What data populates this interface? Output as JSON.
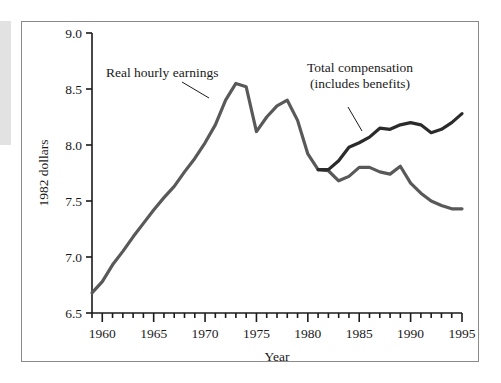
{
  "chart_data": {
    "type": "line",
    "title": "",
    "xlabel": "Year",
    "ylabel": "1982 dollars",
    "xlim": [
      1959,
      1995
    ],
    "ylim": [
      6.5,
      9.0
    ],
    "grid": false,
    "legend_position": "inline-annotations",
    "x_tick_labels": [
      "1960",
      "1965",
      "1970",
      "1975",
      "1980",
      "1985",
      "1990",
      "1995"
    ],
    "x_tick_values": [
      1960,
      1965,
      1970,
      1975,
      1980,
      1985,
      1990,
      1995
    ],
    "x_minor_tick_step": 1,
    "y_tick_labels": [
      "6.5",
      "7.0",
      "7.5",
      "8.0",
      "8.5",
      "9.0"
    ],
    "y_tick_values": [
      6.5,
      7.0,
      7.5,
      8.0,
      8.5,
      9.0
    ],
    "x": [
      1959,
      1960,
      1961,
      1962,
      1963,
      1964,
      1965,
      1966,
      1967,
      1968,
      1969,
      1970,
      1971,
      1972,
      1973,
      1974,
      1975,
      1976,
      1977,
      1978,
      1979,
      1980,
      1981,
      1982,
      1983,
      1984,
      1985,
      1986,
      1987,
      1988,
      1989,
      1990,
      1991,
      1992,
      1993,
      1994,
      1995
    ],
    "series": [
      {
        "name": "Real hourly earnings",
        "color": "#595959",
        "values": [
          6.68,
          6.78,
          6.93,
          7.05,
          7.18,
          7.3,
          7.42,
          7.53,
          7.63,
          7.76,
          7.88,
          8.02,
          8.18,
          8.4,
          8.55,
          8.52,
          8.12,
          8.25,
          8.35,
          8.4,
          8.22,
          7.92,
          7.78,
          7.77,
          7.68,
          7.72,
          7.8,
          7.8,
          7.76,
          7.74,
          7.81,
          7.66,
          7.57,
          7.5,
          7.46,
          7.43,
          7.43
        ]
      },
      {
        "name": "Total compensation (includes benefits)",
        "color": "#2b2b2b",
        "values": [
          null,
          null,
          null,
          null,
          null,
          null,
          null,
          null,
          null,
          null,
          null,
          null,
          null,
          null,
          null,
          null,
          null,
          null,
          null,
          null,
          null,
          null,
          7.78,
          7.78,
          7.86,
          7.98,
          8.02,
          8.07,
          8.15,
          8.14,
          8.18,
          8.2,
          8.18,
          8.11,
          8.14,
          8.2,
          8.28
        ]
      }
    ],
    "annotations": [
      {
        "name": "real-hourly-earnings-annotation",
        "lines": [
          "Real hourly earnings"
        ],
        "text_x": 106,
        "text_y": 77,
        "leader_from_x": 182,
        "leader_from_y": 82,
        "leader_to_x": 209,
        "leader_to_y": 98
      },
      {
        "name": "total-compensation-annotation",
        "lines": [
          "Total compensation",
          "(includes benefits)"
        ],
        "text_x": 307,
        "text_y": 72,
        "leader_from_x": 348,
        "leader_from_y": 107,
        "leader_to_x": 362,
        "leader_to_y": 131
      }
    ]
  }
}
